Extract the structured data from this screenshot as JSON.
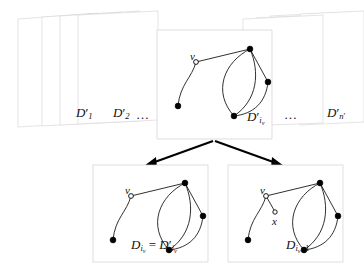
{
  "figure": {
    "background_color": "#ffffff",
    "ink_color": "#111111",
    "card_border_color": "#d9d9d9"
  },
  "top_row": {
    "name": "sequence-of-parts",
    "cards": [
      {
        "id": "card-1",
        "label": "D",
        "prime": "′",
        "subscript": "1",
        "subsubscript": "",
        "has_graph": false
      },
      {
        "id": "card-2",
        "label": "D",
        "prime": "′",
        "subscript": "2",
        "subsubscript": "",
        "has_graph": false
      },
      {
        "id": "card-iv",
        "label": "D",
        "prime": "′",
        "subscript": "i",
        "subsubscript": "v",
        "has_graph": true
      },
      {
        "id": "card-n",
        "label": "D",
        "prime": "′",
        "subscript": "n",
        "subsubscript": "",
        "subscript_prime": "′",
        "has_graph": false
      }
    ],
    "ellipsis_left": "…",
    "ellipsis_right": "…"
  },
  "bottom_row": {
    "name": "split-results",
    "cards": [
      {
        "id": "card-left-result",
        "label_text": "D_{i_v} = D'_{i_v}",
        "has_graph": true,
        "has_new_vertex": false
      },
      {
        "id": "card-right-result",
        "label_text": "D_{i_v+1}",
        "has_graph": true,
        "has_new_vertex": true
      }
    ]
  },
  "vertex_labels": {
    "v": "v",
    "x": "x"
  },
  "graph": {
    "description": "A graph with a pendant path ending at vertex v and a theta/cycle component",
    "vertices": [
      {
        "name": "v",
        "type": "hollow",
        "x": 34,
        "y": 26
      },
      {
        "name": "p1",
        "type": "filled",
        "x": 16,
        "y": 70
      },
      {
        "name": "top",
        "type": "filled",
        "x": 88,
        "y": 13
      },
      {
        "name": "right",
        "type": "filled",
        "x": 106,
        "y": 46
      },
      {
        "name": "bottom",
        "type": "filled",
        "x": 72,
        "y": 80
      }
    ],
    "edges": [
      {
        "from": "v",
        "to": "top",
        "type": "straight"
      },
      {
        "from": "v",
        "to": "p1",
        "type": "curve"
      },
      {
        "from": "top",
        "to": "right",
        "type": "straight"
      },
      {
        "from": "top",
        "to": "bottom",
        "type": "curve-left"
      },
      {
        "from": "top",
        "to": "bottom",
        "type": "curve-right"
      },
      {
        "from": "right",
        "to": "bottom",
        "type": "curve"
      }
    ],
    "new_vertex": {
      "name": "x",
      "type": "hollow",
      "x": 47,
      "y": 44
    },
    "new_edge": {
      "from": "v",
      "to": "x"
    }
  },
  "arrows": {
    "name": "split-arrows",
    "apex_label": "",
    "left_arrow": "arrow-down-left",
    "right_arrow": "arrow-down-right"
  }
}
